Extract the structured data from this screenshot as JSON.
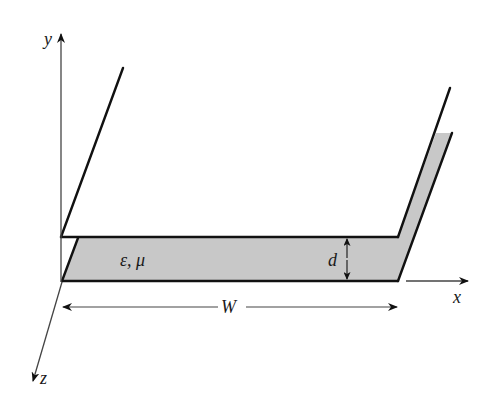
{
  "figure": {
    "type": "parallel-plate waveguide schematic",
    "axes": {
      "y_label": "y",
      "x_label": "x",
      "z_label": "z"
    },
    "material_label": "ε, μ",
    "width_label": "W",
    "separation_label": "d",
    "colors": {
      "line": "#111111",
      "axis": "#444444",
      "fill": "#c8c8c8",
      "background": "#ffffff"
    }
  }
}
